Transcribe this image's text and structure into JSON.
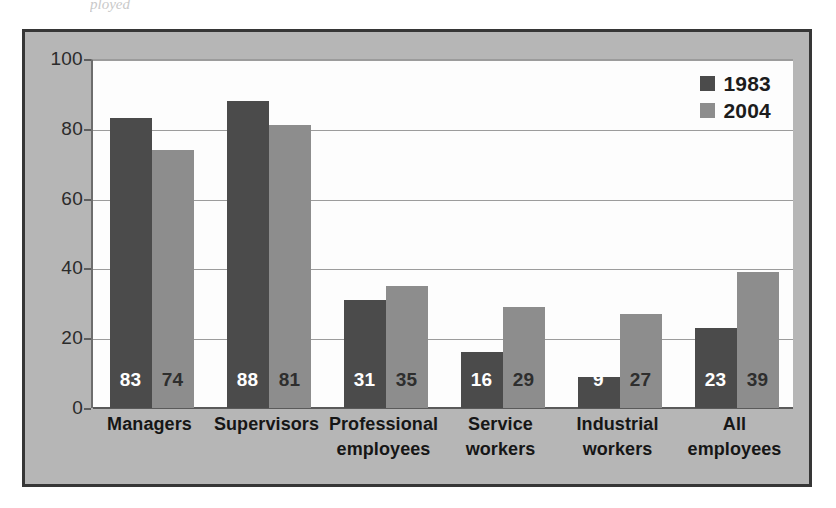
{
  "artifact_text": "ployed",
  "chart_data": {
    "type": "bar",
    "title": "",
    "subtitle": "",
    "xlabel": "",
    "ylabel": "",
    "ylim": [
      0,
      100
    ],
    "yticks": [
      0,
      20,
      40,
      60,
      80,
      100
    ],
    "ytick_labels": [
      "0",
      "20",
      "40",
      "60",
      "80",
      "100"
    ],
    "grid": true,
    "legend_position": "top-right",
    "categories": [
      "Managers",
      "Supervisors",
      "Professional employees",
      "Service workers",
      "Industrial workers",
      "All employees"
    ],
    "category_lines": [
      [
        "Managers"
      ],
      [
        "Supervisors"
      ],
      [
        "Professional",
        "employees"
      ],
      [
        "Service",
        "workers"
      ],
      [
        "Industrial",
        "workers"
      ],
      [
        "All",
        "employees"
      ]
    ],
    "series": [
      {
        "name": "1983",
        "color": "#4b4b4b",
        "values": [
          83,
          88,
          31,
          16,
          9,
          23
        ],
        "value_labels": [
          "83",
          "88",
          "31",
          "16",
          "9",
          "23"
        ]
      },
      {
        "name": "2004",
        "color": "#8d8d8d",
        "values": [
          74,
          81,
          35,
          29,
          27,
          39
        ],
        "value_labels": [
          "74",
          "81",
          "35",
          "29",
          "27",
          "39"
        ]
      }
    ]
  },
  "legend": {
    "entries": [
      {
        "label": "1983",
        "color": "#4b4b4b"
      },
      {
        "label": "2004",
        "color": "#8d8d8d"
      }
    ]
  },
  "colors": {
    "series_1983": "#4b4b4b",
    "series_2004": "#8d8d8d",
    "frame_background": "#b6b6b6",
    "frame_border": "#363636",
    "plot_background": "#fdfdfd",
    "gridline": "#9c9c9c",
    "axis": "#5a5a5a",
    "text": "#1c1c1c"
  }
}
